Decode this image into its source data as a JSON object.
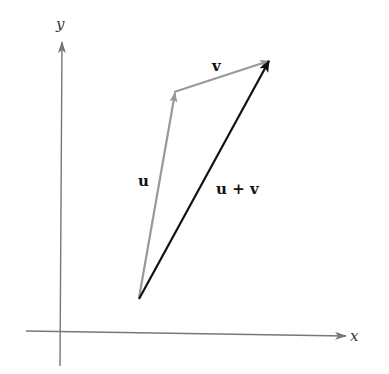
{
  "diagram": {
    "axes": {
      "x_label": "x",
      "y_label": "y",
      "color": "#777777"
    },
    "vectors": [
      {
        "name": "u",
        "label": "u",
        "from": [
          139,
          298
        ],
        "to": [
          175,
          92
        ],
        "color": "#999999"
      },
      {
        "name": "v",
        "label": "v",
        "from": [
          175,
          92
        ],
        "to": [
          270,
          60
        ],
        "color": "#999999"
      },
      {
        "name": "u_plus_v",
        "label": "u + v",
        "from": [
          139,
          298
        ],
        "to": [
          270,
          60
        ],
        "color": "#111111"
      }
    ]
  }
}
